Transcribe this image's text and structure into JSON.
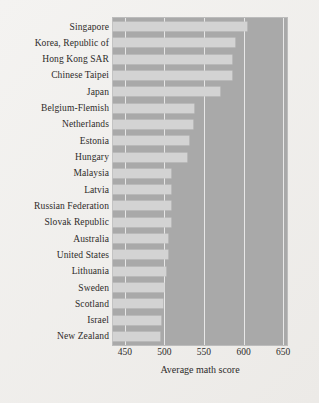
{
  "chart_data": {
    "type": "bar",
    "orientation": "horizontal",
    "title": "",
    "xlabel": "Average math score",
    "ylabel": "",
    "xlim": [
      435,
      655
    ],
    "xticks": [
      450,
      500,
      550,
      600,
      650
    ],
    "grid": true,
    "legend": null,
    "categories": [
      "Singapore",
      "Korea, Republic of",
      "Hong Kong SAR",
      "Chinese Taipei",
      "Japan",
      "Belgium-Flemish",
      "Netherlands",
      "Estonia",
      "Hungary",
      "Malaysia",
      "Latvia",
      "Russian Federation",
      "Slovak Republic",
      "Australia",
      "United States",
      "Lithuania",
      "Sweden",
      "Scotland",
      "Israel",
      "New Zealand"
    ],
    "values": [
      605,
      589,
      586,
      585,
      570,
      537,
      536,
      531,
      529,
      508,
      508,
      508,
      508,
      505,
      504,
      502,
      499,
      498,
      496,
      494
    ],
    "colors": {
      "bar": "#d3d3d3",
      "plot_background": "#a9a9a9",
      "gridline": "#e8e8e8",
      "page_background": "#efeeec",
      "text": "#2d2b29"
    }
  }
}
